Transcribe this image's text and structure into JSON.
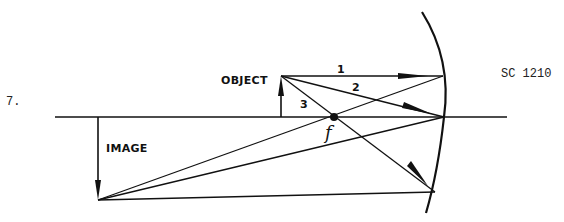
{
  "problem": {
    "number": "7.",
    "code": "SC 1210"
  },
  "labels": {
    "object": "OBJECT",
    "image": "IMAGE",
    "focal_point": "f"
  },
  "rays": [
    {
      "id": "1",
      "label": "1",
      "description": "parallel to axis, reflects through focal point"
    },
    {
      "id": "2",
      "label": "2",
      "description": "toward mirror vertex, reflects symmetrically"
    },
    {
      "id": "3",
      "label": "3",
      "description": "through focal point, reflects parallel to axis"
    }
  ],
  "elements": {
    "mirror": "concave mirror",
    "principal_axis": "principal axis"
  },
  "colors": {
    "ink": "#111111",
    "background": "#ffffff"
  }
}
